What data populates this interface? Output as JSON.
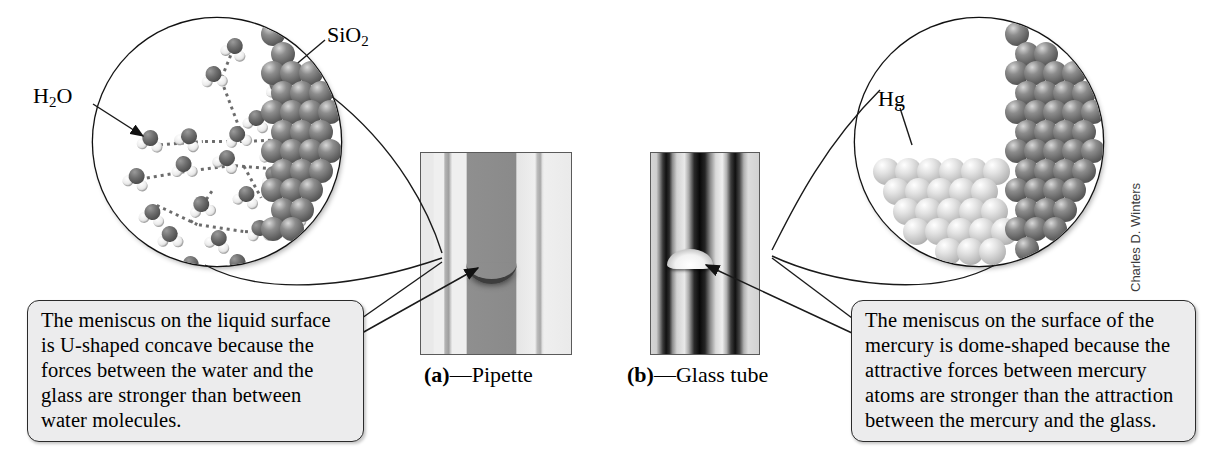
{
  "figure": {
    "credit": "Charles D. Winters"
  },
  "left_panel": {
    "zoom_circle": {
      "name": "water-silica-zoom-circle",
      "labels": {
        "water": "H",
        "water_sub": "2",
        "water_tail": "O",
        "water_full": "H2O",
        "silica": "SiO",
        "silica_sub": "2",
        "silica_full": "SiO2"
      }
    },
    "photo": {
      "name": "pipette-photograph",
      "caption_marker": "(a)",
      "caption_dash": "—",
      "caption_text": "Pipette",
      "meniscus_shape": "U-shaped concave"
    },
    "callout": {
      "lines": [
        "The meniscus on the liquid surface",
        "is U-shaped concave because the",
        "forces between the water and the",
        "glass are stronger than between",
        "water molecules."
      ]
    }
  },
  "right_panel": {
    "zoom_circle": {
      "name": "mercury-silica-zoom-circle",
      "labels": {
        "mercury": "Hg"
      }
    },
    "photo": {
      "name": "glass-tube-photograph",
      "caption_marker": "(b)",
      "caption_dash": "—",
      "caption_text": "Glass tube",
      "meniscus_shape": "dome-shaped convex"
    },
    "callout": {
      "lines": [
        "The meniscus on the surface of the",
        "mercury is dome-shaped because the",
        "attractive forces between mercury",
        "atoms are stronger than the attraction",
        "between the mercury and the glass."
      ]
    }
  },
  "colors": {
    "callout_fill": "#ececed",
    "callout_border": "#2b2b2b",
    "line": "#1a1a1a",
    "silica_atom": "#5d5d5d",
    "mercury_atom": "#b9b9b9",
    "oxygen_atom": "#4a4a4a",
    "hydrogen_atom": "#ededed",
    "page_background": "#ffffff"
  }
}
